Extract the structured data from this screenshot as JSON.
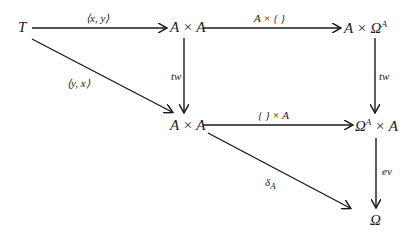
{
  "diagram": {
    "type": "commutative-diagram",
    "nodes": {
      "T": "T",
      "AxA_top": "A × A",
      "AxOmegaA": "A × Ω",
      "AxOmegaA_sup": "A",
      "AxA_mid": "A × A",
      "OmegaAxA": "Ω",
      "OmegaAxA_sup": "A",
      "OmegaAxA_rest": " × A",
      "Omega": "Ω"
    },
    "arrows": {
      "T_to_AxA": "⟨x, y⟩",
      "AxA_to_AxOmegaA": "A × { }",
      "T_to_AxA_mid": "⟨y, x⟩",
      "tw_left": "tw",
      "tw_right": "tw",
      "AxA_to_OmegaAxA": "{ } × A",
      "delta": "δ",
      "delta_sub": "A",
      "ev": "ev"
    },
    "colors": {
      "ink": "#1a1a1a",
      "background": "#ffffff"
    }
  }
}
